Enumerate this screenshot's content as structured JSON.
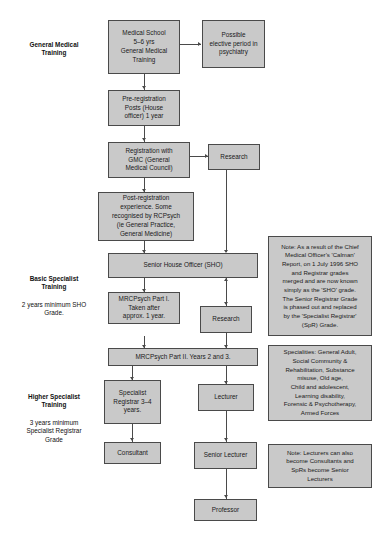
{
  "diagram": {
    "title_cropped": "",
    "stages": [
      {
        "id": "general-medical-training",
        "title": "General Medical\nTraining",
        "subtitle": ""
      },
      {
        "id": "basic-specialist-training",
        "title": "Basic Specialist\nTraining",
        "subtitle": "2 years minimum SHO\nGrade."
      },
      {
        "id": "higher-specialist-training",
        "title": "Higher Specialist\nTraining",
        "subtitle": "3 years minimum\nSpecialist Registrar\nGrade"
      }
    ],
    "nodes": [
      {
        "id": "medical-school",
        "label": "Medical School\n5–6 yrs\nGeneral Medical\nTraining"
      },
      {
        "id": "elective-period",
        "label": "Possible\nelective period in\npsychiatry"
      },
      {
        "id": "pre-registration-posts",
        "label": "Pre-registration\nPosts (House\nofficer) 1 year"
      },
      {
        "id": "gmc-registration",
        "label": "Registration with\nGMC (General\nMedical Council)"
      },
      {
        "id": "research-upper",
        "label": "Research"
      },
      {
        "id": "post-registration",
        "label": "Post-registration\nexperience. Some\nrecognised by RCPsych\n(ie General Practice,\nGeneral Medicine)"
      },
      {
        "id": "senior-house-officer",
        "label": "Senior House Officer (SHO)"
      },
      {
        "id": "mrcpsych-part-1",
        "label": "MRCPsych Part I.\nTaken after\napprox. 1 year."
      },
      {
        "id": "research-lower",
        "label": "Research"
      },
      {
        "id": "mrcpsych-part-2",
        "label": "MRCPsych Part II. Years 2 and 3."
      },
      {
        "id": "specialist-registrar",
        "label": "Specialist\nRegistrar 3–4\nyears."
      },
      {
        "id": "lecturer",
        "label": "Lecturer"
      },
      {
        "id": "consultant",
        "label": "Consultant"
      },
      {
        "id": "senior-lecturer",
        "label": "Senior Lecturer"
      },
      {
        "id": "professor",
        "label": "Professor"
      }
    ],
    "notes": [
      {
        "id": "calman-note",
        "text": "Note: As a result of the Chief\nMedical Officer's 'Calman'\nReport, on 1 July 1996 SHO\nand Registrar grades\nmerged and are now known\nsimply as the 'SHO' grade.\nThe Senior Registrar Grade\nis phased out and replaced\nby the 'Specialist Registrar'\n(SpR) Grade."
      },
      {
        "id": "specialities-note",
        "text": "Specialities: General Adult,\nSocial Community &\nRehabilitation, Substance\nmisuse, Old age,\nChild and adolescent,\nLearning disability,\nForensic & Psychotherapy,\nArmed Forces"
      },
      {
        "id": "lecturers-note",
        "text": "Note: Lecturers can also\nbecome Consultants and\nSpRs become Senior\nLecturers"
      }
    ],
    "colors": {
      "node_fill": "#c9c9c9",
      "node_border": "#4a4a4a",
      "connector": "#4a4a4a",
      "text": "#1a1a1a",
      "background": "#ffffff"
    }
  }
}
